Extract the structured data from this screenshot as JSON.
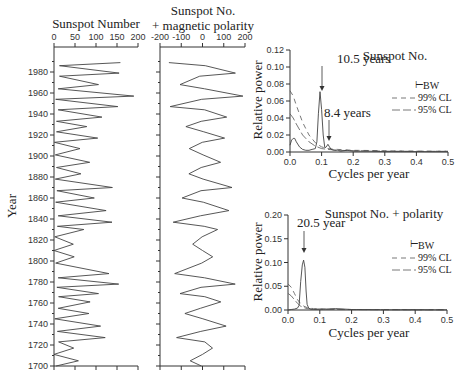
{
  "chart_data": [
    {
      "type": "line",
      "title": "Sunspot Number",
      "xlabel": "",
      "ylabel": "Year",
      "xlim": [
        0,
        200
      ],
      "ylim": [
        1700,
        1990
      ],
      "xticks": [
        "0",
        "50",
        "100",
        "150",
        "200"
      ],
      "yticks": [
        "1700",
        "1720",
        "1740",
        "1760",
        "1780",
        "1800",
        "1820",
        "1840",
        "1860",
        "1880",
        "1900",
        "1920",
        "1940",
        "1960",
        "1980"
      ],
      "series": [
        {
          "name": "Sunspot Number",
          "years": [
            1700,
            1705,
            1711,
            1717,
            1723,
            1727,
            1733,
            1738,
            1745,
            1750,
            1755,
            1761,
            1766,
            1769,
            1775,
            1778,
            1784,
            1788,
            1798,
            1804,
            1810,
            1816,
            1823,
            1830,
            1833,
            1837,
            1843,
            1848,
            1856,
            1860,
            1867,
            1870,
            1878,
            1883,
            1889,
            1894,
            1901,
            1907,
            1913,
            1917,
            1923,
            1928,
            1933,
            1937,
            1944,
            1947,
            1954,
            1957,
            1964,
            1968,
            1976,
            1979,
            1986,
            1989
          ],
          "values": [
            5,
            58,
            0,
            47,
            11,
            122,
            8,
            111,
            2,
            83,
            10,
            86,
            11,
            106,
            7,
            154,
            10,
            131,
            4,
            48,
            0,
            46,
            2,
            71,
            8,
            138,
            10,
            124,
            4,
            96,
            7,
            139,
            3,
            64,
            6,
            85,
            3,
            62,
            1,
            104,
            6,
            78,
            6,
            114,
            10,
            152,
            4,
            190,
            10,
            106,
            13,
            155,
            13,
            158
          ]
        }
      ]
    },
    {
      "type": "line",
      "title": "Sunspot No. + magnetic polarity",
      "xlabel": "",
      "ylabel": "Year",
      "xlim": [
        -200,
        200
      ],
      "ylim": [
        1700,
        1990
      ],
      "xticks": [
        "-200",
        "-100",
        "0",
        "100",
        "200"
      ],
      "series": [
        {
          "name": "Sunspot No. with polarity",
          "years": [
            1700,
            1705,
            1711,
            1717,
            1723,
            1727,
            1733,
            1738,
            1745,
            1750,
            1755,
            1761,
            1766,
            1769,
            1775,
            1778,
            1784,
            1788,
            1798,
            1804,
            1810,
            1816,
            1823,
            1830,
            1833,
            1837,
            1843,
            1848,
            1856,
            1860,
            1867,
            1870,
            1878,
            1883,
            1889,
            1894,
            1901,
            1907,
            1913,
            1917,
            1923,
            1928,
            1933,
            1937,
            1944,
            1947,
            1954,
            1957,
            1964,
            1968,
            1976,
            1979,
            1986,
            1989
          ],
          "values": [
            -5,
            -58,
            0,
            47,
            11,
            -122,
            -8,
            111,
            2,
            -83,
            -10,
            86,
            11,
            -106,
            -7,
            154,
            10,
            -131,
            -4,
            48,
            0,
            -46,
            -2,
            71,
            8,
            -138,
            -10,
            124,
            4,
            -96,
            -7,
            139,
            3,
            -64,
            -6,
            85,
            3,
            -62,
            -1,
            104,
            6,
            -78,
            -6,
            114,
            10,
            -152,
            -4,
            190,
            10,
            -106,
            -13,
            155,
            13,
            -158
          ]
        }
      ]
    },
    {
      "type": "line",
      "title": "Sunspot No.",
      "xlabel": "Cycles per year",
      "ylabel": "Relative power",
      "xlim": [
        0,
        0.5
      ],
      "ylim": [
        0,
        0.12
      ],
      "xticks": [
        "0.0",
        "0.1",
        "0.2",
        "0.3",
        "0.4",
        "0.5"
      ],
      "yticks": [
        "0.00",
        "0.02",
        "0.04",
        "0.06",
        "0.08",
        "0.10",
        "0.12"
      ],
      "annotations": [
        {
          "text": "10.5 years",
          "x": 0.095,
          "y": 0.071
        },
        {
          "text": "8.4 years",
          "x": 0.119,
          "y": 0.009
        }
      ],
      "legend": [
        "BW",
        "99% CL",
        "95% CL"
      ],
      "series": [
        {
          "name": "Spectrum",
          "x": [
            0.0,
            0.005,
            0.01,
            0.015,
            0.02,
            0.03,
            0.04,
            0.05,
            0.06,
            0.07,
            0.08,
            0.085,
            0.09,
            0.095,
            0.1,
            0.105,
            0.11,
            0.115,
            0.12,
            0.125,
            0.13,
            0.14,
            0.15,
            0.16,
            0.18,
            0.2,
            0.25,
            0.3,
            0.35,
            0.4,
            0.45,
            0.5
          ],
          "values": [
            0.008,
            0.014,
            0.016,
            0.016,
            0.012,
            0.006,
            0.003,
            0.002,
            0.002,
            0.003,
            0.004,
            0.012,
            0.045,
            0.071,
            0.05,
            0.02,
            0.005,
            0.006,
            0.009,
            0.006,
            0.003,
            0.002,
            0.002,
            0.001,
            0.002,
            0.001,
            0.001,
            0.0005,
            0.0005,
            0.0005,
            0.0003,
            0.0003
          ]
        },
        {
          "name": "99% CL",
          "x": [
            0.0,
            0.01,
            0.02,
            0.04,
            0.06,
            0.08,
            0.1,
            0.12,
            0.15,
            0.2,
            0.3,
            0.4,
            0.5
          ],
          "values": [
            0.072,
            0.066,
            0.055,
            0.035,
            0.02,
            0.011,
            0.006,
            0.004,
            0.003,
            0.002,
            0.0015,
            0.001,
            0.001
          ]
        },
        {
          "name": "95% CL",
          "x": [
            0.0,
            0.01,
            0.02,
            0.04,
            0.06,
            0.08,
            0.1,
            0.12,
            0.15,
            0.2,
            0.3,
            0.4,
            0.5
          ],
          "values": [
            0.045,
            0.04,
            0.033,
            0.02,
            0.012,
            0.007,
            0.004,
            0.003,
            0.002,
            0.0015,
            0.001,
            0.0008,
            0.0008
          ]
        }
      ]
    },
    {
      "type": "line",
      "title": "Sunspot No. + polarity",
      "xlabel": "Cycles per year",
      "ylabel": "Relative power",
      "xlim": [
        0,
        0.5
      ],
      "ylim": [
        0,
        0.2
      ],
      "xticks": [
        "0.0",
        "0.1",
        "0.2",
        "0.3",
        "0.4",
        "0.5"
      ],
      "yticks": [
        "0.00",
        "0.05",
        "0.10",
        "0.15",
        "0.20"
      ],
      "annotations": [
        {
          "text": "20.5 year",
          "x": 0.049,
          "y": 0.105
        }
      ],
      "legend": [
        "BW",
        "99% CL",
        "95% CL"
      ],
      "series": [
        {
          "name": "Spectrum",
          "x": [
            0.0,
            0.01,
            0.02,
            0.03,
            0.035,
            0.04,
            0.045,
            0.049,
            0.053,
            0.057,
            0.06,
            0.065,
            0.07,
            0.08,
            0.1,
            0.12,
            0.15,
            0.2,
            0.3,
            0.4,
            0.5
          ],
          "values": [
            0.0,
            0.001,
            0.002,
            0.004,
            0.01,
            0.06,
            0.095,
            0.105,
            0.09,
            0.04,
            0.012,
            0.004,
            0.002,
            0.001,
            0.002,
            0.002,
            0.003,
            0.001,
            0.0005,
            0.0005,
            0.0003
          ]
        },
        {
          "name": "99% CL",
          "x": [
            0.0,
            0.01,
            0.02,
            0.03,
            0.04,
            0.05,
            0.06,
            0.08,
            0.1,
            0.15,
            0.2,
            0.3,
            0.4,
            0.5
          ],
          "values": [
            0.055,
            0.048,
            0.035,
            0.022,
            0.013,
            0.008,
            0.005,
            0.003,
            0.002,
            0.0015,
            0.001,
            0.001,
            0.0008,
            0.0008
          ]
        },
        {
          "name": "95% CL",
          "x": [
            0.0,
            0.01,
            0.02,
            0.03,
            0.04,
            0.05,
            0.06,
            0.08,
            0.1,
            0.15,
            0.2,
            0.3,
            0.4,
            0.5
          ],
          "values": [
            0.035,
            0.03,
            0.022,
            0.014,
            0.008,
            0.005,
            0.003,
            0.002,
            0.0015,
            0.001,
            0.0008,
            0.0006,
            0.0005,
            0.0005
          ]
        }
      ]
    }
  ],
  "labels": {
    "p1_title": "Sunspot Number",
    "p2_title_l1": "Sunspot No.",
    "p2_title_l2": "+ magnetic polarity",
    "year_label": "Year",
    "p3_title": "Sunspot No.",
    "p4_title": "Sunspot No. + polarity",
    "rel_power": "Relative power",
    "cycles": "Cycles per year",
    "ann_105": "10.5 years",
    "ann_84": "8.4 years",
    "ann_205": "20.5 year",
    "leg_bw": "BW",
    "leg_99": "99% CL",
    "leg_95": "95% CL"
  }
}
